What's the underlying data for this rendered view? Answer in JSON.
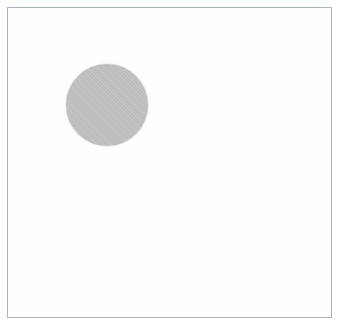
{
  "figure": {
    "background_color": "#ffffff",
    "canvas_color": "#fefefe",
    "frame": {
      "border_color": "#a8b4c4",
      "border_width_px": 1,
      "left_px": 7,
      "top_px": 7,
      "width_px": 325,
      "height_px": 311
    },
    "shapes": [
      {
        "name": "circle",
        "fill_color": "#cbcbcb",
        "texture": "fine-crosshatch-halftone",
        "center_x_px": 107,
        "center_y_px": 105,
        "diameter_px": 82,
        "left_px": 66,
        "top_px": 64
      }
    ],
    "labels": [],
    "text": []
  }
}
